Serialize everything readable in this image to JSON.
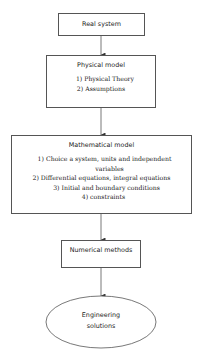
{
  "diagram": {
    "type": "flowchart",
    "nodes": [
      {
        "id": "real-system",
        "title": "Real system",
        "items": []
      },
      {
        "id": "physical-model",
        "title": "Physical model",
        "items": [
          "1)  Physical Theory",
          "2)  Assumptions"
        ]
      },
      {
        "id": "mathematical-model",
        "title": "Mathematical model",
        "items": [
          "1)  Choice a system, units and independent",
          "variables",
          "2)  Differential equations, integral equations",
          "3)  Initial and boundary conditions",
          "4)  constraints"
        ]
      },
      {
        "id": "numerical-methods",
        "title": "Numerical methods",
        "items": []
      },
      {
        "id": "engineering-solutions",
        "title_lines": [
          "Engineering",
          "solutions"
        ],
        "shape": "ellipse"
      }
    ],
    "edges": [
      [
        "real-system",
        "physical-model"
      ],
      [
        "physical-model",
        "mathematical-model"
      ],
      [
        "mathematical-model",
        "numerical-methods"
      ],
      [
        "numerical-methods",
        "engineering-solutions"
      ]
    ],
    "line_color": "#555555"
  }
}
